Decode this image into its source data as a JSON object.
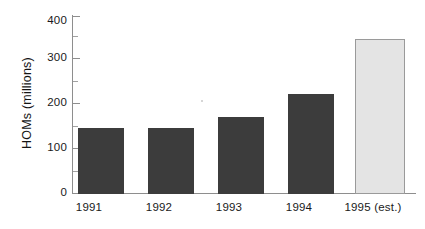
{
  "chart_data": {
    "type": "bar",
    "title": "",
    "subtitle": "",
    "xlabel": "",
    "ylabel": "HOMs (millions)",
    "categories": [
      "1991",
      "1992",
      "1993",
      "1994",
      "1995 (est.)"
    ],
    "values": [
      150,
      150,
      175,
      225,
      350
    ],
    "series": [
      {
        "name": "HOMs",
        "values": [
          150,
          150,
          175,
          225,
          350
        ]
      }
    ],
    "ylim": [
      0,
      400
    ],
    "xlim": null,
    "y_major_ticks": [
      0,
      100,
      200,
      300,
      400
    ],
    "y_minor_ticks": [
      50,
      150,
      250,
      350
    ],
    "y_tick_labels": [
      "0",
      "100",
      "200",
      "300",
      "400"
    ],
    "grid": false,
    "legend": null,
    "legend_position": "none",
    "annotations": [],
    "bar_styles": [
      {
        "category": "1991",
        "fill": "#3c3c3c",
        "border": "none",
        "kind": "actual"
      },
      {
        "category": "1992",
        "fill": "#3c3c3c",
        "border": "none",
        "kind": "actual"
      },
      {
        "category": "1993",
        "fill": "#3c3c3c",
        "border": "none",
        "kind": "actual"
      },
      {
        "category": "1994",
        "fill": "#3c3c3c",
        "border": "none",
        "kind": "actual"
      },
      {
        "category": "1995 (est.)",
        "fill": "#e4e4e4",
        "border": "#9a9a9a",
        "kind": "estimate"
      }
    ],
    "colors": {
      "background": "#ffffff",
      "bar_dark": "#3c3c3c",
      "bar_light": "#e4e4e4",
      "bar_light_border": "#9a9a9a",
      "axis": "#8e8e8e",
      "text": "#1a1a1a"
    }
  },
  "axis": {
    "y_labels": {
      "t400": "400",
      "t300": "300",
      "t200": "200",
      "t100": "100",
      "t0": "0"
    },
    "y_title": "HOMs (millions)"
  },
  "x_labels": {
    "c0": "1991",
    "c1": "1992",
    "c2": "1993",
    "c3": "1994",
    "c4": "1995 (est.)"
  }
}
